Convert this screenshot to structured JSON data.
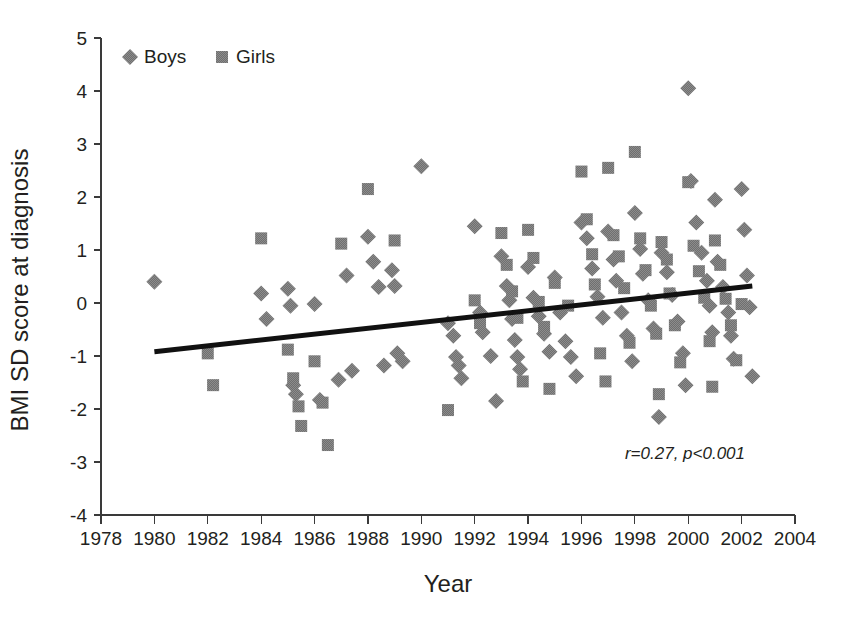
{
  "chart_data": {
    "type": "scatter",
    "title": "",
    "xlabel": "Year",
    "ylabel": "BMI SD score at diagnosis",
    "xlim": [
      1978,
      2004
    ],
    "ylim": [
      -4,
      5
    ],
    "xticks": [
      1978,
      1980,
      1982,
      1984,
      1986,
      1988,
      1990,
      1992,
      1994,
      1996,
      1998,
      2000,
      2002,
      2004
    ],
    "yticks": [
      -4,
      -3,
      -2,
      -1,
      0,
      1,
      2,
      3,
      4,
      5
    ],
    "xtick_labels": [
      "1978",
      "1980",
      "1982",
      "1984",
      "1986",
      "1988",
      "1990",
      "1992",
      "1994",
      "1996",
      "1998",
      "2000",
      "2002",
      "2004"
    ],
    "ytick_labels": [
      "-4",
      "-3",
      "-2",
      "-1",
      "0",
      "1",
      "2",
      "3",
      "4",
      "5"
    ],
    "grid": false,
    "legend_position": "top-left",
    "marker_color": "#6f6f6f",
    "trendline_color": "#111111",
    "annotation": "r=0.27, p<0.001",
    "trendline": {
      "x_start": 1980.0,
      "y_start": -0.92,
      "x_end": 2002.4,
      "y_end": 0.32
    },
    "series": [
      {
        "name": "Boys",
        "marker": "diamond",
        "color": "#6f6f6f",
        "points": [
          [
            1980.0,
            0.4
          ],
          [
            1984.0,
            0.18
          ],
          [
            1984.2,
            -0.3
          ],
          [
            1985.0,
            0.27
          ],
          [
            1985.1,
            -0.05
          ],
          [
            1985.2,
            -1.55
          ],
          [
            1985.3,
            -1.72
          ],
          [
            1986.0,
            -0.02
          ],
          [
            1986.2,
            -1.83
          ],
          [
            1986.9,
            -1.45
          ],
          [
            1987.2,
            0.52
          ],
          [
            1987.4,
            -1.28
          ],
          [
            1988.0,
            1.25
          ],
          [
            1988.2,
            0.78
          ],
          [
            1988.4,
            0.3
          ],
          [
            1988.6,
            -1.18
          ],
          [
            1988.9,
            0.62
          ],
          [
            1989.0,
            0.32
          ],
          [
            1989.1,
            -0.95
          ],
          [
            1989.3,
            -1.1
          ],
          [
            1990.0,
            2.58
          ],
          [
            1991.0,
            -0.38
          ],
          [
            1991.2,
            -0.62
          ],
          [
            1991.3,
            -1.02
          ],
          [
            1991.4,
            -1.18
          ],
          [
            1991.5,
            -1.42
          ],
          [
            1992.0,
            1.45
          ],
          [
            1992.2,
            -0.18
          ],
          [
            1992.3,
            -0.55
          ],
          [
            1992.6,
            -1.0
          ],
          [
            1992.8,
            -1.85
          ],
          [
            1993.0,
            0.88
          ],
          [
            1993.2,
            0.32
          ],
          [
            1993.3,
            0.05
          ],
          [
            1993.4,
            -0.3
          ],
          [
            1993.5,
            -0.7
          ],
          [
            1993.6,
            -1.02
          ],
          [
            1993.7,
            -1.25
          ],
          [
            1994.0,
            0.68
          ],
          [
            1994.2,
            0.1
          ],
          [
            1994.4,
            -0.25
          ],
          [
            1994.6,
            -0.58
          ],
          [
            1994.8,
            -0.92
          ],
          [
            1995.0,
            0.48
          ],
          [
            1995.2,
            -0.18
          ],
          [
            1995.4,
            -0.72
          ],
          [
            1995.6,
            -1.02
          ],
          [
            1995.8,
            -1.38
          ],
          [
            1996.0,
            1.52
          ],
          [
            1996.2,
            1.22
          ],
          [
            1996.4,
            0.65
          ],
          [
            1996.6,
            0.12
          ],
          [
            1996.8,
            -0.28
          ],
          [
            1997.0,
            1.35
          ],
          [
            1997.2,
            0.82
          ],
          [
            1997.3,
            0.42
          ],
          [
            1997.5,
            -0.18
          ],
          [
            1997.7,
            -0.62
          ],
          [
            1997.9,
            -1.1
          ],
          [
            1998.0,
            1.7
          ],
          [
            1998.2,
            1.02
          ],
          [
            1998.3,
            0.55
          ],
          [
            1998.5,
            0.05
          ],
          [
            1998.7,
            -0.48
          ],
          [
            1998.9,
            -2.15
          ],
          [
            1999.0,
            0.95
          ],
          [
            1999.2,
            0.58
          ],
          [
            1999.4,
            0.15
          ],
          [
            1999.6,
            -0.35
          ],
          [
            1999.8,
            -0.95
          ],
          [
            1999.9,
            -1.55
          ],
          [
            2000.0,
            4.05
          ],
          [
            2000.1,
            2.3
          ],
          [
            2000.3,
            1.52
          ],
          [
            2000.5,
            0.95
          ],
          [
            2000.7,
            0.42
          ],
          [
            2000.8,
            -0.05
          ],
          [
            2000.9,
            -0.55
          ],
          [
            2001.0,
            1.95
          ],
          [
            2001.1,
            0.78
          ],
          [
            2001.3,
            0.3
          ],
          [
            2001.5,
            -0.18
          ],
          [
            2001.6,
            -0.62
          ],
          [
            2001.7,
            -1.05
          ],
          [
            2002.0,
            2.15
          ],
          [
            2002.1,
            1.38
          ],
          [
            2002.2,
            0.52
          ],
          [
            2002.3,
            -0.08
          ],
          [
            2002.4,
            -1.38
          ]
        ]
      },
      {
        "name": "Girls",
        "marker": "square",
        "color": "#6f6f6f",
        "points": [
          [
            1982.0,
            -0.95
          ],
          [
            1982.2,
            -1.55
          ],
          [
            1984.0,
            1.22
          ],
          [
            1985.0,
            -0.88
          ],
          [
            1985.2,
            -1.42
          ],
          [
            1985.4,
            -1.95
          ],
          [
            1985.5,
            -2.32
          ],
          [
            1986.0,
            -1.1
          ],
          [
            1986.3,
            -1.88
          ],
          [
            1986.5,
            -2.68
          ],
          [
            1987.0,
            1.12
          ],
          [
            1988.0,
            2.15
          ],
          [
            1989.0,
            1.18
          ],
          [
            1991.0,
            -2.02
          ],
          [
            1992.0,
            0.05
          ],
          [
            1992.2,
            -0.38
          ],
          [
            1993.0,
            1.32
          ],
          [
            1993.2,
            0.72
          ],
          [
            1993.4,
            0.22
          ],
          [
            1993.6,
            -0.28
          ],
          [
            1993.8,
            -1.48
          ],
          [
            1994.0,
            1.38
          ],
          [
            1994.2,
            0.85
          ],
          [
            1994.4,
            0.02
          ],
          [
            1994.6,
            -0.45
          ],
          [
            1994.8,
            -1.62
          ],
          [
            1995.0,
            0.38
          ],
          [
            1995.5,
            -0.05
          ],
          [
            1996.0,
            2.48
          ],
          [
            1996.2,
            1.58
          ],
          [
            1996.4,
            0.92
          ],
          [
            1996.5,
            0.35
          ],
          [
            1996.7,
            -0.95
          ],
          [
            1996.9,
            -1.48
          ],
          [
            1997.0,
            2.55
          ],
          [
            1997.2,
            1.28
          ],
          [
            1997.4,
            0.88
          ],
          [
            1997.6,
            0.28
          ],
          [
            1997.8,
            -0.75
          ],
          [
            1998.0,
            2.85
          ],
          [
            1998.2,
            1.22
          ],
          [
            1998.4,
            0.62
          ],
          [
            1998.6,
            -0.05
          ],
          [
            1998.8,
            -0.58
          ],
          [
            1998.9,
            -1.72
          ],
          [
            1999.0,
            1.15
          ],
          [
            1999.2,
            0.82
          ],
          [
            1999.3,
            0.18
          ],
          [
            1999.5,
            -0.42
          ],
          [
            1999.7,
            -1.12
          ],
          [
            2000.0,
            2.28
          ],
          [
            2000.2,
            1.08
          ],
          [
            2000.4,
            0.6
          ],
          [
            2000.6,
            0.1
          ],
          [
            2000.8,
            -0.72
          ],
          [
            2000.9,
            -1.58
          ],
          [
            2001.0,
            1.18
          ],
          [
            2001.2,
            0.72
          ],
          [
            2001.4,
            0.08
          ],
          [
            2001.6,
            -0.42
          ],
          [
            2001.8,
            -1.08
          ],
          [
            2002.0,
            -0.02
          ]
        ]
      }
    ]
  },
  "legend": {
    "entries": [
      {
        "label": "Boys",
        "marker": "diamond"
      },
      {
        "label": "Girls",
        "marker": "square"
      }
    ]
  }
}
